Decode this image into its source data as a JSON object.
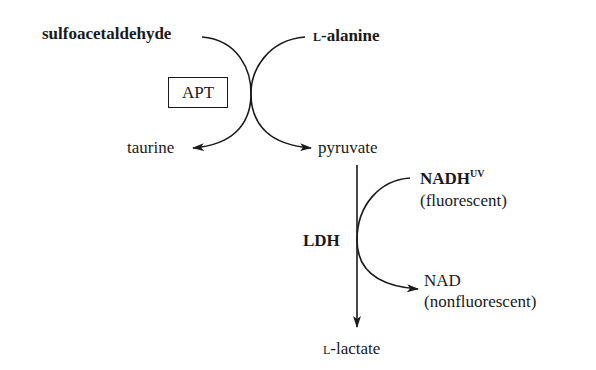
{
  "diagram": {
    "type": "enzyme-coupled reaction scheme",
    "reaction1": {
      "enzyme": "APT",
      "substrates": [
        "sulfoacetaldehyde",
        "L-alanine"
      ],
      "products": [
        "taurine",
        "pyruvate"
      ]
    },
    "reaction2": {
      "enzyme": "LDH",
      "substrate": "pyruvate",
      "product": "L-lactate",
      "cofactor_in": "NADH",
      "cofactor_in_superscript": "UV",
      "cofactor_in_note": "(fluorescent)",
      "cofactor_out": "NAD",
      "cofactor_out_note": "(nonfluorescent)"
    }
  },
  "labels": {
    "sulfoacetaldehyde": "sulfoacetaldehyde",
    "alanine_prefix": "L",
    "alanine_rest": "-alanine",
    "apt": "APT",
    "taurine": "taurine",
    "pyruvate": "pyruvate",
    "nadh": "NADH",
    "nadh_sup": "UV",
    "fluorescent": "(fluorescent)",
    "ldh": "LDH",
    "nad": "NAD",
    "nonfluorescent": "(nonfluorescent)",
    "lactate_prefix": "L",
    "lactate_rest": "-lactate"
  },
  "colors": {
    "ink": "#1a1a1a",
    "background": "#ffffff"
  }
}
